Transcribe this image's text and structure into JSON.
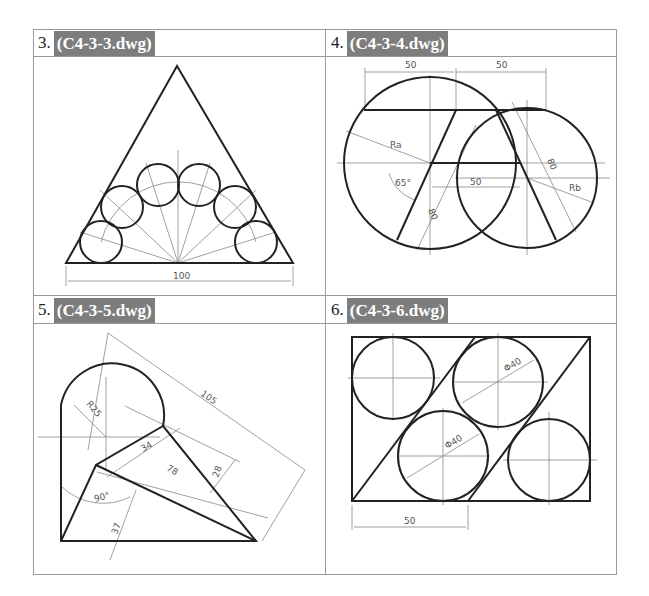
{
  "panels": [
    {
      "number": "3.",
      "file": "(C4-3-3.dwg)",
      "dims": {
        "base": "100"
      }
    },
    {
      "number": "4.",
      "file": "(C4-3-4.dwg)",
      "dims": {
        "top_left": "50",
        "top_right": "50",
        "ra": "Ra",
        "rb": "Rb",
        "angle": "65°",
        "mid": "50",
        "len_left": "80",
        "len_right": "80"
      }
    },
    {
      "number": "5.",
      "file": "(C4-3-5.dwg)",
      "dims": {
        "r": "R25",
        "overall": "105",
        "a": "34",
        "b": "78",
        "c": "28",
        "angle": "90°",
        "d": "37"
      }
    },
    {
      "number": "6.",
      "file": "(C4-3-6.dwg)",
      "dims": {
        "dia1": "Φ40",
        "dia2": "Φ40",
        "width": "50"
      }
    }
  ]
}
